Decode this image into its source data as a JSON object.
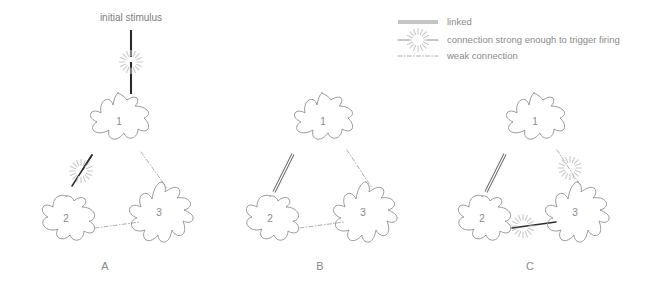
{
  "figure": {
    "stimulus_label": "initial stimulus",
    "panels": [
      {
        "id": "A",
        "label": "A",
        "cells": [
          {
            "id": "1",
            "label": "1"
          },
          {
            "id": "2",
            "label": "2"
          },
          {
            "id": "3",
            "label": "3"
          }
        ],
        "connections": [
          {
            "from": "1",
            "to": "2",
            "type": "firing",
            "burst": true
          },
          {
            "from": "1",
            "to": "3",
            "type": "weak",
            "burst": false
          },
          {
            "from": "2",
            "to": "3",
            "type": "weak",
            "burst": false
          }
        ],
        "has_initial_stimulus": true
      },
      {
        "id": "B",
        "label": "B",
        "cells": [
          {
            "id": "1",
            "label": "1"
          },
          {
            "id": "2",
            "label": "2"
          },
          {
            "id": "3",
            "label": "3"
          }
        ],
        "connections": [
          {
            "from": "1",
            "to": "2",
            "type": "linked",
            "burst": false
          },
          {
            "from": "1",
            "to": "3",
            "type": "weak",
            "burst": false
          },
          {
            "from": "2",
            "to": "3",
            "type": "weak",
            "burst": false
          }
        ],
        "has_initial_stimulus": false
      },
      {
        "id": "C",
        "label": "C",
        "cells": [
          {
            "id": "1",
            "label": "1"
          },
          {
            "id": "2",
            "label": "2"
          },
          {
            "id": "3",
            "label": "3"
          }
        ],
        "connections": [
          {
            "from": "1",
            "to": "2",
            "type": "linked",
            "burst": false
          },
          {
            "from": "1",
            "to": "3",
            "type": "weak",
            "burst": true
          },
          {
            "from": "2",
            "to": "3",
            "type": "firing",
            "burst": true
          }
        ],
        "has_initial_stimulus": false
      }
    ]
  },
  "legend": {
    "items": [
      {
        "key": "linked",
        "symbol": "double-line",
        "label": "linked"
      },
      {
        "key": "firing",
        "symbol": "line-with-burst",
        "label": "connection strong enough to trigger firing"
      },
      {
        "key": "weak",
        "symbol": "dash-dot-line",
        "label": "weak connection"
      }
    ]
  },
  "colors": {
    "outline": "#8f8f8f",
    "text": "#8a8a8a",
    "strong_line": "#2e2e2e",
    "burst": "#c9c9c9",
    "background": "#ffffff"
  }
}
